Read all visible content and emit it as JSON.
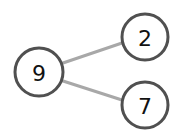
{
  "diagram": {
    "type": "number-bond",
    "whole": {
      "value": "9",
      "cx": 39,
      "cy": 72,
      "r": 24
    },
    "parts": [
      {
        "value": "2",
        "cx": 145,
        "cy": 37,
        "r": 23
      },
      {
        "value": "7",
        "cx": 145,
        "cy": 105,
        "r": 23
      }
    ],
    "colors": {
      "circle_stroke": "#505050",
      "edge": "#a8a8a8",
      "text": "#111111",
      "background": "#ffffff"
    }
  }
}
